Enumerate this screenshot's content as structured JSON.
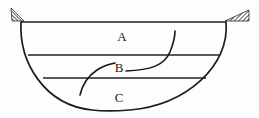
{
  "diagram": {
    "background_color": "#fdfdfb",
    "line_color": "#1d1d1d",
    "hatch_color": "#3a3a3a",
    "labels": [
      {
        "id": "label-a",
        "text": "A",
        "x": 122,
        "y": 38
      },
      {
        "id": "label-b",
        "text": "B",
        "x": 119,
        "y": 69
      },
      {
        "id": "label-c",
        "text": "C",
        "x": 119,
        "y": 99
      }
    ],
    "rim": {
      "name": "top-rim-line",
      "x1": 21,
      "y1": 22,
      "x2": 226,
      "y2": 22
    },
    "bowl": {
      "name": "bowl-outline",
      "left_top_x": 21,
      "left_top_y": 22,
      "right_top_x": 226,
      "right_top_y": 22,
      "bottom_y": 111,
      "path": "M 21 22 C 19 62, 44 105, 92 110 C 100 111, 118 111, 130 110 C 186 105, 230 66, 226 22"
    },
    "strata": [
      {
        "name": "strata-line-upper",
        "label": "A/B boundary",
        "x1": 28,
        "y1": 55,
        "x2": 219,
        "y2": 55
      },
      {
        "name": "strata-line-lower",
        "label": "B/C boundary",
        "x1": 43,
        "y1": 78,
        "x2": 206,
        "y2": 78
      }
    ],
    "curves": [
      {
        "name": "flow-curve-upper",
        "label": "curve through A into B",
        "path": "M 126 71 C 150 70, 164 66, 170 52 C 174 42, 175 35, 175 31"
      },
      {
        "name": "flow-curve-lower",
        "label": "curve through B into C",
        "path": "M 80 95 C 82 86, 88 76, 97 70 C 103 66, 110 64, 115 63"
      }
    ],
    "supports": [
      {
        "name": "support-wedge-left",
        "side": "left",
        "hatched": true,
        "points": "11,8 24,21 12,21"
      },
      {
        "name": "support-wedge-right",
        "side": "right",
        "hatched": true,
        "points": "225,21 249,10 249,21"
      }
    ]
  }
}
